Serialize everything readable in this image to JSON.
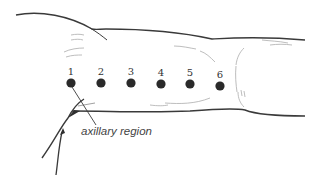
{
  "diagram": {
    "points": [
      {
        "label": "1",
        "x": 71,
        "y": 83
      },
      {
        "label": "2",
        "x": 101,
        "y": 83
      },
      {
        "label": "3",
        "x": 131,
        "y": 83
      },
      {
        "label": "4",
        "x": 161,
        "y": 84
      },
      {
        "label": "5",
        "x": 190,
        "y": 84
      },
      {
        "label": "6",
        "x": 220,
        "y": 86
      }
    ],
    "annotation": {
      "text": "axillary region",
      "x": 81,
      "y": 135
    },
    "colors": {
      "outline": "#3a3a3a",
      "sketch": "#b5b5b5",
      "dot": "#2a2a2a"
    }
  }
}
